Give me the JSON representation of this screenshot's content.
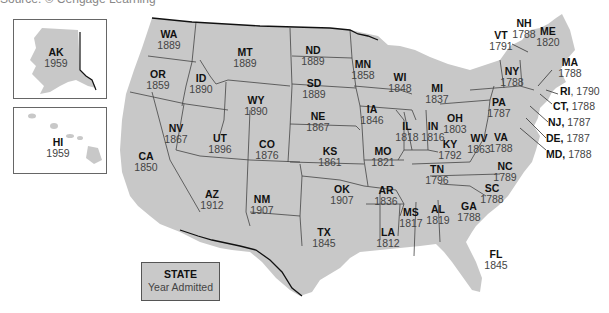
{
  "source_line": "Source: © Cengage Learning",
  "colors": {
    "land": "#c8c8c8",
    "border": "#333333",
    "water": "#ffffff"
  },
  "legend": {
    "title": "STATE",
    "subtitle": "Year Admitted"
  },
  "insets": {
    "alaska": {
      "abbr": "AK",
      "year": "1959"
    },
    "hawaii": {
      "abbr": "HI",
      "year": "1959"
    }
  },
  "states": {
    "WA": {
      "abbr": "WA",
      "year": "1889"
    },
    "OR": {
      "abbr": "OR",
      "year": "1859"
    },
    "CA": {
      "abbr": "CA",
      "year": "1850"
    },
    "ID": {
      "abbr": "ID",
      "year": "1890"
    },
    "NV": {
      "abbr": "NV",
      "year": "1867"
    },
    "MT": {
      "abbr": "MT",
      "year": "1889"
    },
    "WY": {
      "abbr": "WY",
      "year": "1890"
    },
    "UT": {
      "abbr": "UT",
      "year": "1896"
    },
    "CO": {
      "abbr": "CO",
      "year": "1876"
    },
    "AZ": {
      "abbr": "AZ",
      "year": "1912"
    },
    "NM": {
      "abbr": "NM",
      "year": "1907"
    },
    "ND": {
      "abbr": "ND",
      "year": "1889"
    },
    "SD": {
      "abbr": "SD",
      "year": "1889"
    },
    "NE": {
      "abbr": "NE",
      "year": "1867"
    },
    "KS": {
      "abbr": "KS",
      "year": "1861"
    },
    "OK": {
      "abbr": "OK",
      "year": "1907"
    },
    "TX": {
      "abbr": "TX",
      "year": "1845"
    },
    "MN": {
      "abbr": "MN",
      "year": "1858"
    },
    "IA": {
      "abbr": "IA",
      "year": "1846"
    },
    "MO": {
      "abbr": "MO",
      "year": "1821"
    },
    "AR": {
      "abbr": "AR",
      "year": "1836"
    },
    "LA": {
      "abbr": "LA",
      "year": "1812"
    },
    "WI": {
      "abbr": "WI",
      "year": "1848"
    },
    "IL": {
      "abbr": "IL",
      "year": "1818"
    },
    "MI": {
      "abbr": "MI",
      "year": "1837"
    },
    "IN": {
      "abbr": "IN",
      "year": "1816"
    },
    "OH": {
      "abbr": "OH",
      "year": "1803"
    },
    "KY": {
      "abbr": "KY",
      "year": "1792"
    },
    "TN": {
      "abbr": "TN",
      "year": "1796"
    },
    "MS": {
      "abbr": "MS",
      "year": "1817"
    },
    "AL": {
      "abbr": "AL",
      "year": "1819"
    },
    "GA": {
      "abbr": "GA",
      "year": "1788"
    },
    "FL": {
      "abbr": "FL",
      "year": "1845"
    },
    "SC": {
      "abbr": "SC",
      "year": "1788"
    },
    "NC": {
      "abbr": "NC",
      "year": "1789"
    },
    "VA": {
      "abbr": "VA",
      "year": "1788"
    },
    "WV": {
      "abbr": "WV",
      "year": "1863"
    },
    "PA": {
      "abbr": "PA",
      "year": "1787"
    },
    "NY": {
      "abbr": "NY",
      "year": "1788"
    },
    "VT": {
      "abbr": "VT",
      "year": "1791"
    },
    "NH": {
      "abbr": "NH",
      "year": "1788"
    },
    "ME": {
      "abbr": "ME",
      "year": "1820"
    },
    "MA": {
      "abbr": "MA",
      "year": "1788"
    },
    "RI": {
      "abbr": "RI",
      "year": "1790"
    },
    "CT": {
      "abbr": "CT",
      "year": "1788"
    },
    "NJ": {
      "abbr": "NJ",
      "year": "1787"
    },
    "DE": {
      "abbr": "DE",
      "year": "1787"
    },
    "MD": {
      "abbr": "MD",
      "year": "1788"
    }
  }
}
